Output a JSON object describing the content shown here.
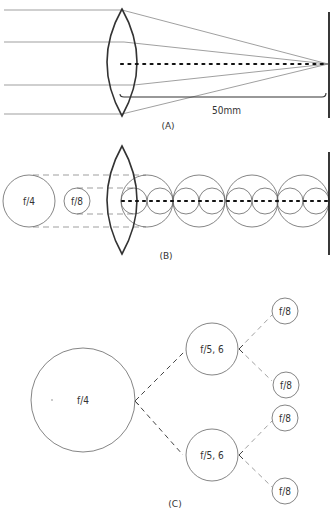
{
  "diagram": {
    "colors": {
      "line": "#555555",
      "dark": "#222222",
      "background": "#ffffff"
    },
    "panel_a": {
      "caption": "(A)",
      "distance_label": "50mm",
      "lens": "converging-lens",
      "ray_count": 4,
      "film_plane": "sensor-plane"
    },
    "panel_b": {
      "caption": "(B)",
      "aperture_large_label": "f/4",
      "aperture_small_label": "f/8",
      "large_circle_count": 4,
      "small_circle_count": 8
    },
    "panel_c": {
      "caption": "(C)",
      "root_label": "f/4",
      "mid_labels": [
        "f/5, 6",
        "f/5, 6"
      ],
      "leaf_labels": [
        "f/8",
        "f/8",
        "f/8",
        "f/8"
      ]
    }
  }
}
